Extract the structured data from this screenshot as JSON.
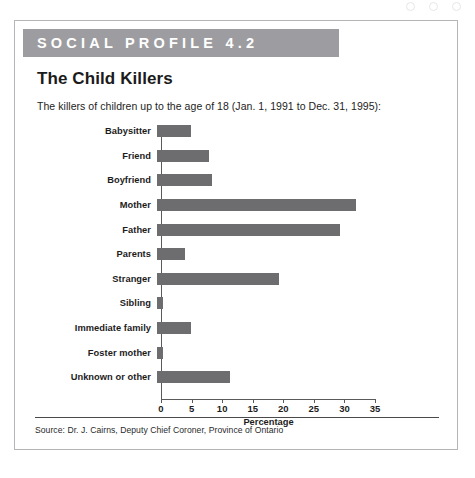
{
  "banner": {
    "label": "SOCIAL PROFILE 4.2"
  },
  "title": "The Child Killers",
  "subtitle": "The killers of children up to the age of 18 (Jan. 1, 1991 to Dec. 31, 1995):",
  "source": "Source: Dr. J. Cairns, Deputy Chief Coroner, Province of Ontario",
  "colors": {
    "banner_bg": "#9d9da1",
    "bar": "#6d6d70",
    "axis": "#5a5a5c",
    "border": "#b5b5b7"
  },
  "chart_data": {
    "type": "bar",
    "orientation": "horizontal",
    "title": "The Child Killers",
    "subtitle": "The killers of children up to the age of 18 (Jan. 1, 1991 to Dec. 31, 1995):",
    "categories": [
      "Babysitter",
      "Friend",
      "Boyfriend",
      "Mother",
      "Father",
      "Parents",
      "Stranger",
      "Sibling",
      "Immediate family",
      "Foster mother",
      "Unknown or other"
    ],
    "values": [
      5.5,
      8.5,
      9,
      32.5,
      30,
      4.5,
      20,
      1,
      5.5,
      1,
      12
    ],
    "xlabel": "Percentage",
    "ylabel": "",
    "xlim": [
      0,
      35
    ],
    "xticks": [
      0,
      5,
      10,
      15,
      20,
      25,
      30,
      35
    ],
    "grid": false,
    "legend": false,
    "source": "Source: Dr. J. Cairns, Deputy Chief Coroner, Province of Ontario"
  }
}
